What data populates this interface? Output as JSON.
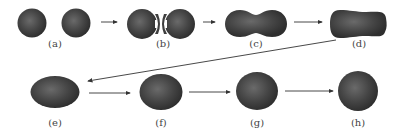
{
  "diagram": {
    "type": "process-sequence",
    "colors": {
      "drop": "#3a3a3a",
      "drop_highlight": "#6a6a6a",
      "arrow": "#333333",
      "label": "#444444"
    },
    "stages": [
      {
        "id": "a",
        "label": "(a)",
        "shape": "two-separate-spheres"
      },
      {
        "id": "b",
        "label": "(b)",
        "shape": "two-touching-spheres"
      },
      {
        "id": "c",
        "label": "(c)",
        "shape": "peanut-neck"
      },
      {
        "id": "d",
        "label": "(d)",
        "shape": "elongated-capsule"
      },
      {
        "id": "e",
        "label": "(e)",
        "shape": "oblate-ellipse"
      },
      {
        "id": "f",
        "label": "(f)",
        "shape": "ellipse"
      },
      {
        "id": "g",
        "label": "(g)",
        "shape": "near-sphere"
      },
      {
        "id": "h",
        "label": "(h)",
        "shape": "sphere"
      }
    ],
    "arrows": [
      {
        "from": "a",
        "to": "b"
      },
      {
        "from": "b",
        "to": "c"
      },
      {
        "from": "c",
        "to": "d"
      },
      {
        "from": "d",
        "to": "e"
      },
      {
        "from": "e",
        "to": "f"
      },
      {
        "from": "f",
        "to": "g"
      },
      {
        "from": "g",
        "to": "h"
      }
    ]
  }
}
